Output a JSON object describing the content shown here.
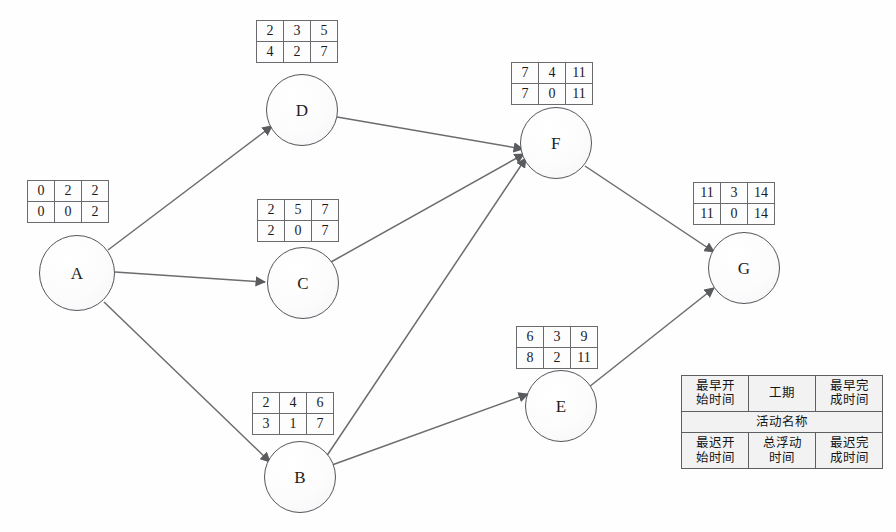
{
  "diagram": {
    "type": "precedence-network",
    "nodes": [
      {
        "id": "A",
        "label": "A",
        "cx": 77,
        "cy": 273,
        "r": 38,
        "table": {
          "x": 27,
          "y": 180,
          "early_start": "0",
          "duration": "2",
          "early_finish": "2",
          "late_start": "0",
          "total_float": "0",
          "late_finish": "2"
        }
      },
      {
        "id": "D",
        "label": "D",
        "cx": 302,
        "cy": 110,
        "r": 36,
        "table": {
          "x": 256,
          "y": 20,
          "early_start": "2",
          "duration": "3",
          "early_finish": "5",
          "late_start": "4",
          "total_float": "2",
          "late_finish": "7"
        }
      },
      {
        "id": "C",
        "label": "C",
        "cx": 303,
        "cy": 283,
        "r": 36,
        "table": {
          "x": 257,
          "y": 199,
          "early_start": "2",
          "duration": "5",
          "early_finish": "7",
          "late_start": "2",
          "total_float": "0",
          "late_finish": "7"
        }
      },
      {
        "id": "B",
        "label": "B",
        "cx": 300,
        "cy": 477,
        "r": 36,
        "table": {
          "x": 252,
          "y": 392,
          "early_start": "2",
          "duration": "4",
          "early_finish": "6",
          "late_start": "3",
          "total_float": "1",
          "late_finish": "7"
        }
      },
      {
        "id": "F",
        "label": "F",
        "cx": 556,
        "cy": 143,
        "r": 36,
        "table": {
          "x": 511,
          "y": 62,
          "early_start": "7",
          "duration": "4",
          "early_finish": "11",
          "late_start": "7",
          "total_float": "0",
          "late_finish": "11"
        }
      },
      {
        "id": "E",
        "label": "E",
        "cx": 561,
        "cy": 406,
        "r": 36,
        "table": {
          "x": 516,
          "y": 326,
          "early_start": "6",
          "duration": "3",
          "early_finish": "9",
          "late_start": "8",
          "total_float": "2",
          "late_finish": "11"
        }
      },
      {
        "id": "G",
        "label": "G",
        "cx": 744,
        "cy": 268,
        "r": 36,
        "table": {
          "x": 693,
          "y": 182,
          "early_start": "11",
          "duration": "3",
          "early_finish": "14",
          "late_start": "11",
          "total_float": "0",
          "late_finish": "14"
        }
      }
    ],
    "edges": [
      {
        "from": "A",
        "to": "D"
      },
      {
        "from": "A",
        "to": "C"
      },
      {
        "from": "A",
        "to": "B"
      },
      {
        "from": "D",
        "to": "F"
      },
      {
        "from": "C",
        "to": "F"
      },
      {
        "from": "B",
        "to": "F"
      },
      {
        "from": "B",
        "to": "E"
      },
      {
        "from": "F",
        "to": "G"
      },
      {
        "from": "E",
        "to": "G"
      }
    ]
  },
  "legend": {
    "early_start": "最早开\n始时间",
    "early_start_l1": "最早开",
    "early_start_l2": "始时间",
    "duration": "工期",
    "early_finish_l1": "最早完",
    "early_finish_l2": "成时间",
    "activity_name": "活动名称",
    "late_start_l1": "最迟开",
    "late_start_l2": "始时间",
    "total_float_l1": "总浮动",
    "total_float_l2": "时间",
    "late_finish_l1": "最迟完",
    "late_finish_l2": "成时间"
  },
  "style": {
    "node_stroke": "#55565a",
    "edge_stroke": "#6b6c70",
    "table_border": "#6a6b6f",
    "legend_bg": "#f2f2f2",
    "background": "#ffffff"
  }
}
